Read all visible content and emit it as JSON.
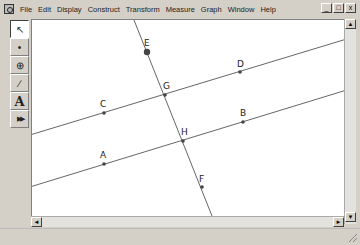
{
  "menubar": {
    "items": [
      "File",
      "Edit",
      "Display",
      "Construct",
      "Transform",
      "Measure",
      "Graph",
      "Window",
      "Help"
    ],
    "window_buttons": [
      "_",
      "□",
      "x"
    ]
  },
  "toolbox": {
    "tools": [
      {
        "name": "selection-arrow-tool",
        "glyph": "↖",
        "active": true
      },
      {
        "name": "point-tool",
        "glyph": "•",
        "active": false
      },
      {
        "name": "compass-tool",
        "glyph": "⊕",
        "active": false
      },
      {
        "name": "straightedge-tool",
        "glyph": "∕",
        "active": false
      },
      {
        "name": "text-tool",
        "glyph": "A",
        "active": false
      },
      {
        "name": "custom-tool",
        "glyph": "▶▶",
        "active": false
      }
    ]
  },
  "sketch": {
    "points": [
      {
        "label": "A",
        "x": 104,
        "y": 164
      },
      {
        "label": "B",
        "x": 243,
        "y": 122
      },
      {
        "label": "C",
        "x": 104,
        "y": 113
      },
      {
        "label": "D",
        "x": 240,
        "y": 72
      },
      {
        "label": "E",
        "x": 147,
        "y": 52
      },
      {
        "label": "F",
        "x": 202,
        "y": 187
      },
      {
        "label": "G",
        "x": 165,
        "y": 95
      },
      {
        "label": "H",
        "x": 183,
        "y": 141
      }
    ],
    "lines": [
      {
        "name": "line-CD",
        "through": [
          "C",
          "G",
          "D"
        ]
      },
      {
        "name": "line-AB",
        "through": [
          "A",
          "H",
          "B"
        ]
      },
      {
        "name": "transversal-EF",
        "through": [
          "E",
          "G",
          "H",
          "F"
        ]
      }
    ]
  },
  "scrollbars": {
    "up": "▲",
    "down": "▼",
    "left": "◄",
    "right": "►"
  }
}
